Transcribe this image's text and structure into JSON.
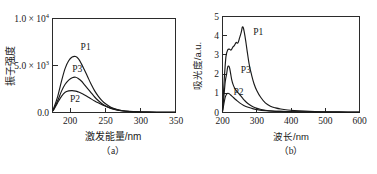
{
  "figure": {
    "background_color": "#ffffff",
    "ink_color": "#1a1a1a",
    "panels": [
      "a",
      "b"
    ]
  },
  "panel_a": {
    "caption": "（a）",
    "xlabel": "激发能量/nm",
    "ylabel": "振子强度",
    "xticks": [
      "200",
      "250",
      "300",
      "350"
    ],
    "yticks": [
      "0.0",
      "5.0 × 10",
      "1.0 × 10"
    ],
    "y_exponents": [
      "",
      "3",
      "4"
    ],
    "curve_labels": [
      "P1",
      "P3",
      "P2"
    ]
  },
  "panel_b": {
    "caption": "（b）",
    "xlabel": "波长/nm",
    "ylabel": "吸光度/a.u.",
    "xticks": [
      "200",
      "300",
      "400",
      "500",
      "600"
    ],
    "yticks": [
      "0",
      "1",
      "2",
      "3",
      "4",
      "5"
    ],
    "curve_labels": [
      "P1",
      "P3",
      "P2"
    ]
  },
  "chart_data": [
    {
      "id": "panel-a",
      "type": "line",
      "title": "（a）",
      "xlabel": "激发能量/nm",
      "ylabel": "振子强度",
      "xlim": [
        175,
        350
      ],
      "ylim": [
        0,
        10000
      ],
      "xticks": [
        200,
        250,
        300,
        350
      ],
      "yticks": [
        0,
        5000,
        10000
      ],
      "ytick_labels": [
        "0.0",
        "5.0 × 10^3",
        "1.0 × 10^4"
      ],
      "grid": false,
      "legend": "inline-labels",
      "series": [
        {
          "name": "P1",
          "label_position": [
            215,
            6700
          ],
          "x": [
            176,
            182,
            188,
            193,
            198,
            203,
            208,
            212,
            216,
            220,
            225,
            230,
            235,
            240,
            245,
            250,
            258,
            266,
            275,
            285,
            295,
            310,
            330,
            350
          ],
          "y": [
            300,
            1600,
            3400,
            4700,
            5500,
            5900,
            5950,
            5700,
            5200,
            4600,
            3800,
            3000,
            2300,
            1750,
            1300,
            950,
            560,
            330,
            190,
            110,
            70,
            40,
            25,
            20
          ]
        },
        {
          "name": "P3",
          "label_position": [
            203,
            4350
          ],
          "x": [
            176,
            182,
            188,
            193,
            198,
            203,
            208,
            212,
            216,
            220,
            225,
            230,
            235,
            240,
            245,
            250,
            258,
            266,
            275,
            285,
            295,
            310,
            330,
            350
          ],
          "y": [
            250,
            1200,
            2300,
            3000,
            3450,
            3700,
            3750,
            3600,
            3350,
            3000,
            2550,
            2100,
            1650,
            1280,
            960,
            720,
            440,
            270,
            160,
            95,
            60,
            35,
            22,
            18
          ]
        },
        {
          "name": "P2",
          "label_position": [
            200,
            1150
          ],
          "x": [
            176,
            182,
            188,
            193,
            198,
            203,
            208,
            212,
            216,
            220,
            225,
            230,
            235,
            240,
            245,
            250,
            258,
            266,
            275,
            285,
            295,
            310,
            330,
            350
          ],
          "y": [
            200,
            1000,
            1750,
            2150,
            2300,
            2330,
            2280,
            2180,
            2050,
            1900,
            1680,
            1450,
            1230,
            1030,
            850,
            690,
            470,
            310,
            190,
            115,
            70,
            40,
            24,
            18
          ]
        }
      ]
    },
    {
      "id": "panel-b",
      "type": "line",
      "title": "（b）",
      "xlabel": "波长/nm",
      "ylabel": "吸光度/a.u.",
      "xlim": [
        200,
        600
      ],
      "ylim": [
        0,
        5
      ],
      "xticks": [
        200,
        300,
        400,
        500,
        600
      ],
      "yticks": [
        0,
        1,
        2,
        3,
        4,
        5
      ],
      "grid": false,
      "legend": "inline-labels",
      "series": [
        {
          "name": "P1",
          "label_position": [
            290,
            4.05
          ],
          "x": [
            200,
            205,
            210,
            215,
            220,
            225,
            230,
            235,
            240,
            245,
            250,
            255,
            258,
            261,
            264,
            268,
            272,
            278,
            285,
            292,
            300,
            312,
            325,
            340,
            355,
            370,
            390,
            410,
            440,
            470,
            500,
            540,
            600
          ],
          "y": [
            0.1,
            1.7,
            2.9,
            3.25,
            3.3,
            3.25,
            3.4,
            3.5,
            3.65,
            3.62,
            3.9,
            4.2,
            4.45,
            4.4,
            4.15,
            3.7,
            3.2,
            2.5,
            1.95,
            1.5,
            1.15,
            0.78,
            0.5,
            0.33,
            0.24,
            0.18,
            0.13,
            0.1,
            0.07,
            0.05,
            0.04,
            0.03,
            0.02
          ]
        },
        {
          "name": "P3",
          "label_position": [
            253,
            2.05
          ],
          "x": [
            200,
            204,
            208,
            212,
            215,
            218,
            221,
            224,
            227,
            231,
            236,
            242,
            250,
            258,
            266,
            275,
            285,
            296,
            310,
            325,
            345,
            365,
            390,
            420,
            460,
            500,
            545,
            600
          ],
          "y": [
            0.05,
            0.8,
            1.6,
            2.0,
            2.35,
            2.42,
            2.3,
            2.0,
            1.7,
            1.45,
            1.25,
            1.1,
            0.93,
            0.76,
            0.6,
            0.46,
            0.34,
            0.25,
            0.17,
            0.12,
            0.08,
            0.06,
            0.045,
            0.035,
            0.025,
            0.02,
            0.015,
            0.012
          ]
        },
        {
          "name": "P2",
          "label_position": [
            232,
            0.92
          ],
          "x": [
            200,
            204,
            208,
            212,
            216,
            220,
            226,
            232,
            240,
            250,
            262,
            275,
            290,
            305,
            325,
            345,
            370,
            400,
            440,
            480,
            520,
            560,
            600
          ],
          "y": [
            0.04,
            0.45,
            0.8,
            0.95,
            1.0,
            0.97,
            0.88,
            0.78,
            0.65,
            0.5,
            0.37,
            0.27,
            0.19,
            0.14,
            0.1,
            0.075,
            0.055,
            0.04,
            0.03,
            0.022,
            0.018,
            0.014,
            0.01
          ]
        }
      ]
    }
  ]
}
